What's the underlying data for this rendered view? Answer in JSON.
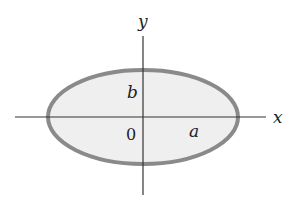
{
  "diagram": {
    "colors": {
      "background": "#ffffff",
      "ellipse_fill": "#efefef",
      "ellipse_stroke": "#8a8a8a",
      "axis": "#333333",
      "text": "#222222"
    },
    "ellipse": {
      "cx": 143,
      "cy": 117,
      "rx": 95,
      "ry": 47,
      "stroke_width": 4
    },
    "x_axis": {
      "x1": 15,
      "y1": 117,
      "x2": 266,
      "y2": 117,
      "label": "x"
    },
    "y_axis": {
      "x1": 143,
      "y1": 36,
      "x2": 143,
      "y2": 195,
      "label": "y"
    },
    "labels": {
      "origin": "0",
      "semi_major": "a",
      "semi_minor": "b"
    }
  }
}
